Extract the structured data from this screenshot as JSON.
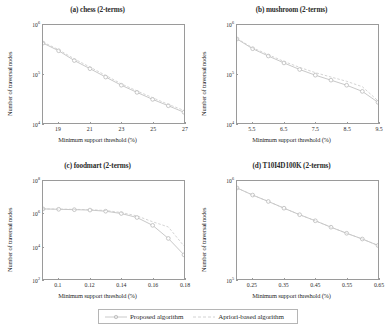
{
  "figure": {
    "ylabel": "Number of traversal nodes",
    "xlabel": "Minimum support threshold (%)",
    "colors": {
      "proposed": "#b9b9b9",
      "apriori": "#c8c8c8",
      "axis": "#9a9a9a",
      "text": "#2b2b2b"
    }
  },
  "legend": {
    "entries": [
      {
        "label": "Proposed algorithm",
        "marker": "circle-marker",
        "style": "solid"
      },
      {
        "label": "Apriori-based algorithm",
        "marker": "none",
        "style": "dashed"
      }
    ]
  },
  "chart_data": [
    {
      "type": "line",
      "title": "(a) chess (2-terms)",
      "xlabel": "Minimum support threshold (%)",
      "ylabel": "Number of traversal nodes",
      "yscale": "log",
      "xlim": [
        18,
        27
      ],
      "ylim": [
        10000,
        1000000
      ],
      "xticks": [
        19,
        21,
        23,
        25,
        27
      ],
      "yticks": [
        "10^6",
        "10^5",
        "10^4"
      ],
      "grid": false,
      "x": [
        18,
        19,
        20,
        21,
        22,
        23,
        24,
        25,
        26,
        27
      ],
      "series": [
        {
          "name": "Proposed algorithm",
          "values": [
            430000,
            300000,
            190000,
            130000,
            88000,
            60000,
            43000,
            31000,
            23000,
            17000
          ]
        },
        {
          "name": "Apriori-based algorithm",
          "values": [
            450000,
            315000,
            205000,
            140000,
            95000,
            64000,
            46000,
            33500,
            24500,
            18500
          ]
        }
      ]
    },
    {
      "type": "line",
      "title": "(b) mushroom (2-terms)",
      "xlabel": "Minimum support threshold (%)",
      "ylabel": "Number of traversal nodes",
      "yscale": "log",
      "xlim": [
        5.0,
        9.5
      ],
      "ylim": [
        10000,
        1000000
      ],
      "xticks": [
        5.5,
        6.5,
        7.5,
        8.5,
        9.5
      ],
      "yticks": [
        "10^6",
        "10^5",
        "10^4"
      ],
      "grid": false,
      "x": [
        5.0,
        5.5,
        6.0,
        6.5,
        7.0,
        7.5,
        8.0,
        8.5,
        9.0,
        9.5
      ],
      "series": [
        {
          "name": "Proposed algorithm",
          "values": [
            520000,
            330000,
            235000,
            170000,
            125000,
            96000,
            76000,
            60000,
            45000,
            27000
          ]
        },
        {
          "name": "Apriori-based algorithm",
          "values": [
            530000,
            345000,
            250000,
            182000,
            138000,
            108000,
            88000,
            72000,
            56000,
            29000
          ]
        }
      ]
    },
    {
      "type": "line",
      "title": "(c) foodmart (2-terms)",
      "xlabel": "Minimum support threshold (%)",
      "ylabel": "Number of traversal nodes",
      "yscale": "log",
      "xlim": [
        0.09,
        0.18
      ],
      "ylim": [
        100,
        100000000
      ],
      "xticks": [
        0.1,
        0.12,
        0.14,
        0.16,
        0.18
      ],
      "yticks": [
        "10^8",
        "10^6",
        "10^4",
        "10^2"
      ],
      "grid": false,
      "x": [
        0.09,
        0.1,
        0.11,
        0.12,
        0.13,
        0.14,
        0.15,
        0.16,
        0.17,
        0.18
      ],
      "series": [
        {
          "name": "Proposed algorithm",
          "values": [
            2000000,
            1900000,
            1800000,
            1700000,
            1450000,
            1050000,
            600000,
            200000,
            32000,
            3200
          ]
        },
        {
          "name": "Apriori-based algorithm",
          "values": [
            2000000,
            1950000,
            1880000,
            1800000,
            1600000,
            1200000,
            750000,
            330000,
            160000,
            11000
          ]
        }
      ]
    },
    {
      "type": "line",
      "title": "(d) T10I4D100K (2-terms)",
      "xlabel": "Minimum support threshold (%)",
      "ylabel": "Number of traversal nodes",
      "yscale": "log",
      "xlim": [
        0.2,
        0.65
      ],
      "ylim": [
        100000,
        1000000
      ],
      "xticks": [
        0.25,
        0.35,
        0.45,
        0.55,
        0.65
      ],
      "yticks": [
        "10^6",
        "10^5"
      ],
      "grid": false,
      "x": [
        0.2,
        0.25,
        0.3,
        0.35,
        0.4,
        0.45,
        0.5,
        0.55,
        0.6,
        0.65
      ],
      "series": [
        {
          "name": "Proposed algorithm",
          "values": [
            850000,
            720000,
            620000,
            530000,
            455000,
            395000,
            340000,
            295000,
            258000,
            222000
          ]
        },
        {
          "name": "Apriori-based algorithm",
          "values": [
            850000,
            720000,
            620000,
            530000,
            455000,
            395000,
            340000,
            295000,
            258000,
            222000
          ]
        }
      ]
    }
  ]
}
